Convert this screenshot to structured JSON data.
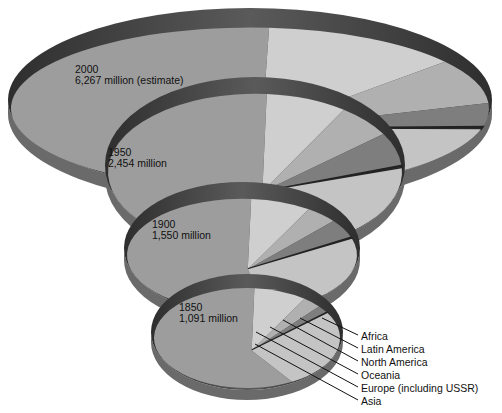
{
  "chart_data": {
    "type": "pie",
    "title": "",
    "style": "stacked 3D pie discs, one per year",
    "categories": [
      "Africa",
      "Latin America",
      "North America",
      "Oceania",
      "Europe (including USSR)",
      "Asia"
    ],
    "series": [
      {
        "name": "1850",
        "label": "1850",
        "total_label": "1,091 million",
        "total": 1091,
        "values": [
          102,
          38,
          26,
          2,
          276,
          647
        ]
      },
      {
        "name": "1900",
        "label": "1900",
        "total_label": "1,550 million",
        "total": 1550,
        "values": [
          133,
          74,
          82,
          6,
          408,
          847
        ]
      },
      {
        "name": "1950",
        "label": "1950",
        "total_label": "2,454 million",
        "total": 2454,
        "values": [
          222,
          162,
          166,
          13,
          570,
          1321
        ]
      },
      {
        "name": "2000",
        "label": "2000",
        "total_label": "6,267 million (estimate)",
        "total": 6267,
        "values": [
          872,
          547,
          298,
          31,
          851,
          3668
        ]
      }
    ],
    "legend": [
      "Africa",
      "Latin America",
      "North America",
      "Oceania",
      "Europe (including USSR)",
      "Asia"
    ],
    "legend_position": "bottom-right, leader lines to 1850 disc"
  },
  "discs": [
    {
      "year": "2000",
      "value": "6,267 million (estimate)"
    },
    {
      "year": "1950",
      "value": "2,454 million"
    },
    {
      "year": "1900",
      "value": "1,550 million"
    },
    {
      "year": "1850",
      "value": "1,091 million"
    }
  ],
  "legend": {
    "items": [
      "Africa",
      "Latin America",
      "North America",
      "Oceania",
      "Europe (including USSR)",
      "Asia"
    ]
  },
  "colors": {
    "asia": "#9d9d9d",
    "europe": "#c4c4c4",
    "oceania": "#3a3a3a",
    "north_america": "#7e7e7e",
    "latin_america": "#b0b0b0",
    "africa": "#cfcfcf",
    "rim": "#4a4a4a"
  }
}
